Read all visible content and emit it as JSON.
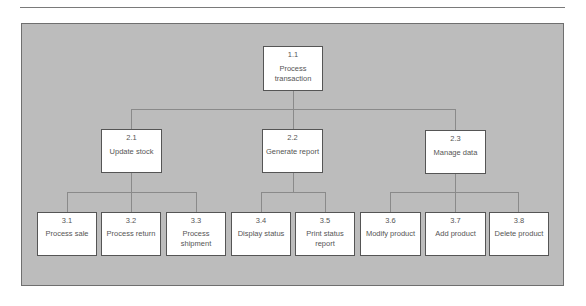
{
  "diagram": {
    "type": "hierarchy-chart",
    "colors": {
      "background": "#bcbcbc",
      "box_fill": "#ffffff",
      "box_border": "#555555",
      "connector": "#8a8a8a",
      "text": "#555555"
    },
    "root": {
      "id": "1.1",
      "label": "Process transaction"
    },
    "level2": [
      {
        "id": "2.1",
        "label": "Update stock"
      },
      {
        "id": "2.2",
        "label": "Generate report"
      },
      {
        "id": "2.3",
        "label": "Manage data"
      }
    ],
    "level3": [
      {
        "id": "3.1",
        "label": "Process sale",
        "parent": "2.1"
      },
      {
        "id": "3.2",
        "label": "Process return",
        "parent": "2.1"
      },
      {
        "id": "3.3",
        "label": "Process shipment",
        "parent": "2.1"
      },
      {
        "id": "3.4",
        "label": "Display status",
        "parent": "2.2"
      },
      {
        "id": "3.5",
        "label": "Print status report",
        "parent": "2.2"
      },
      {
        "id": "3.6",
        "label": "Modify product",
        "parent": "2.3"
      },
      {
        "id": "3.7",
        "label": "Add product",
        "parent": "2.3"
      },
      {
        "id": "3.8",
        "label": "Delete product",
        "parent": "2.3"
      }
    ]
  }
}
